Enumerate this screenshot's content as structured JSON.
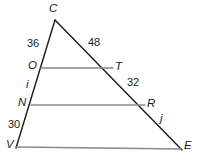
{
  "figure": {
    "width": 200,
    "height": 164,
    "background": "#ffffff",
    "stroke_dark": "#1a1a1a",
    "stroke_gray": "#8a8a8a"
  },
  "vertices": {
    "C": {
      "label": "C",
      "x": 55,
      "y": 20,
      "label_x": 49,
      "label_y": 3
    },
    "O": {
      "label": "O",
      "x": 41,
      "y": 68,
      "label_x": 28,
      "label_y": 61
    },
    "T": {
      "label": "T",
      "x": 113,
      "y": 68,
      "label_x": 115,
      "label_y": 61
    },
    "N": {
      "label": "N",
      "x": 31,
      "y": 105,
      "label_x": 18,
      "label_y": 98
    },
    "R": {
      "label": "R",
      "x": 145,
      "y": 105,
      "label_x": 147,
      "label_y": 98
    },
    "V": {
      "label": "V",
      "x": 16,
      "y": 148,
      "label_x": 6,
      "label_y": 139
    },
    "E": {
      "label": "E",
      "x": 182,
      "y": 150,
      "label_x": 184,
      "label_y": 140
    }
  },
  "segments": [
    {
      "name": "left-transversal-CV",
      "from": "C",
      "to": "V",
      "color": "#1a1a1a"
    },
    {
      "name": "right-transversal-CE",
      "from": "C",
      "to": "E",
      "color": "#1a1a1a"
    },
    {
      "name": "parallel-OT",
      "from": "O",
      "to": "T",
      "color": "#8a8a8a"
    },
    {
      "name": "parallel-NR",
      "from": "N",
      "to": "R",
      "color": "#8a8a8a"
    },
    {
      "name": "base-VE",
      "from": "V",
      "to": "E",
      "color": "#8a8a8a"
    }
  ],
  "measurements": [
    {
      "name": "measure-CO",
      "value": "36",
      "x": 27,
      "y": 38
    },
    {
      "name": "measure-CT",
      "value": "48",
      "x": 88,
      "y": 37
    },
    {
      "name": "measure-TR",
      "value": "32",
      "x": 127,
      "y": 77
    },
    {
      "name": "measure-NV",
      "value": "30",
      "x": 8,
      "y": 119
    }
  ],
  "line_labels": [
    {
      "name": "line-label-i",
      "value": "i",
      "x": 26,
      "y": 80
    },
    {
      "name": "line-label-j",
      "value": "j",
      "x": 160,
      "y": 114
    }
  ]
}
